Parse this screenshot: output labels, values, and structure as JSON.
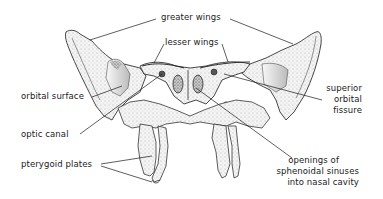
{
  "figure": {
    "labels": {
      "greater_wings": "greater wings",
      "lesser_wings": "lesser wings",
      "orbital_surface": "orbital surface",
      "optic_canal": "optic canal",
      "pterygoid_plates": "pterygoid plates",
      "superior_orbital_fissure_1": "superior",
      "superior_orbital_fissure_2": "orbital",
      "superior_orbital_fissure_3": "fissure",
      "openings_1": "openings of",
      "openings_2": "sphenoidal sinuses",
      "openings_3": "into nasal cavity"
    },
    "colors": {
      "ink": "#1a1a1a",
      "bone_light": "#f2f2f2",
      "bone_shade": "#bdbdbd",
      "bone_dark": "#555555",
      "background": "#ffffff"
    }
  }
}
